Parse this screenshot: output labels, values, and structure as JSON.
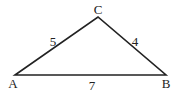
{
  "diagram": {
    "type": "triangle",
    "stroke_color": "#222222",
    "vertices": {
      "A": {
        "label": "A",
        "x": 15,
        "y": 75
      },
      "B": {
        "label": "B",
        "x": 166,
        "y": 75
      },
      "C": {
        "label": "C",
        "x": 98,
        "y": 17
      }
    },
    "sides": {
      "AC": {
        "label": "5"
      },
      "CB": {
        "label": "4"
      },
      "AB": {
        "label": "7"
      }
    }
  }
}
